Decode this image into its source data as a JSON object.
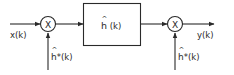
{
  "diagram": {
    "type": "block-diagram",
    "input_label": "x(k)",
    "output_label": "y(k)",
    "multiplier_1": {
      "symbol": "X",
      "side_input_label_base": "h",
      "side_input_label_rest": "*(k)",
      "side_input_hat": "^"
    },
    "filter_block": {
      "label_base": "h",
      "label_rest": " (k)",
      "hat": "^"
    },
    "multiplier_2": {
      "symbol": "X",
      "side_input_label_base": "h",
      "side_input_label_rest": "*(k)",
      "side_input_hat": "^"
    },
    "colors": {
      "stroke": "#2a2a2a",
      "background": "#ffffff"
    }
  }
}
